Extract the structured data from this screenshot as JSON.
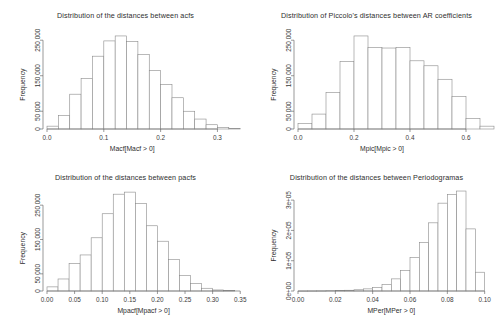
{
  "figure": {
    "panel_count": 4,
    "layout": "2x2",
    "background_color": "#ffffff",
    "bar_fill": "#ffffff",
    "bar_stroke": "#8a8a8a",
    "axis_color": "#6e6e6e"
  },
  "chart_data": [
    {
      "id": "acf",
      "type": "bar",
      "title": "Distribution of the distances between acfs",
      "xlabel": "Macf[Macf > 0]",
      "ylabel": "Frequency",
      "xlim": [
        0.0,
        0.345
      ],
      "ylim": [
        0,
        290000
      ],
      "xticks": [
        0.0,
        0.1,
        0.2,
        0.3
      ],
      "xticklabels": [
        "0.0",
        "0.1",
        "0.2",
        "0.3"
      ],
      "yticks": [
        0,
        50000,
        150000,
        250000
      ],
      "yticklabels": [
        "0",
        "50 000",
        "150 000",
        "250 000"
      ],
      "grid": false,
      "legend": "none",
      "bin_width": 0.02,
      "bin_edges": [
        0.0,
        0.02,
        0.04,
        0.06,
        0.08,
        0.1,
        0.12,
        0.14,
        0.16,
        0.18,
        0.2,
        0.22,
        0.24,
        0.26,
        0.28,
        0.3,
        0.32,
        0.34
      ],
      "values": [
        8000,
        38000,
        98000,
        142000,
        205000,
        248000,
        262000,
        246000,
        210000,
        165000,
        125000,
        88000,
        50000,
        28000,
        12000,
        4000,
        1500
      ]
    },
    {
      "id": "piccolo",
      "type": "bar",
      "title": "Distribution of Piccolo's distances between AR coefficients",
      "xlabel": "Mpic[Mpic > 0]",
      "ylabel": "Frequency",
      "xlim": [
        0.0,
        0.7
      ],
      "ylim": [
        0,
        290000
      ],
      "xticks": [
        0.0,
        0.2,
        0.4,
        0.6
      ],
      "xticklabels": [
        "0.0",
        "0.2",
        "0.4",
        "0.6"
      ],
      "yticks": [
        0,
        50000,
        150000,
        250000
      ],
      "yticklabels": [
        "0",
        "50 000",
        "150 000",
        "250 000"
      ],
      "grid": false,
      "legend": "none",
      "bin_width": 0.05,
      "bin_edges": [
        0.0,
        0.05,
        0.1,
        0.15,
        0.2,
        0.25,
        0.3,
        0.35,
        0.4,
        0.45,
        0.5,
        0.55,
        0.6,
        0.65,
        0.7
      ],
      "values": [
        15000,
        42000,
        103000,
        190000,
        262000,
        230000,
        228000,
        229000,
        192000,
        178000,
        140000,
        92000,
        30000,
        8000
      ]
    },
    {
      "id": "pacf",
      "type": "bar",
      "title": "Distribution of the distances between pacfs",
      "xlabel": "Mpacf[Mpacf > 0]",
      "ylabel": "Frequency",
      "xlim": [
        0.0,
        0.355
      ],
      "ylim": [
        0,
        300000
      ],
      "xticks": [
        0.0,
        0.05,
        0.1,
        0.15,
        0.2,
        0.25,
        0.3,
        0.35
      ],
      "xticklabels": [
        "0.00",
        "0.05",
        "0.10",
        "0.15",
        "0.20",
        "0.25",
        "0.30",
        "0.35"
      ],
      "yticks": [
        0,
        50000,
        150000,
        250000
      ],
      "yticklabels": [
        "0",
        "50 000",
        "150 000",
        "250 000"
      ],
      "grid": false,
      "legend": "none",
      "bin_width": 0.02,
      "bin_edges": [
        0.0,
        0.02,
        0.04,
        0.06,
        0.08,
        0.1,
        0.12,
        0.14,
        0.16,
        0.18,
        0.2,
        0.22,
        0.24,
        0.26,
        0.28,
        0.3,
        0.32,
        0.34
      ],
      "values": [
        12000,
        35000,
        80000,
        105000,
        155000,
        225000,
        282000,
        288000,
        255000,
        190000,
        145000,
        92000,
        45000,
        22000,
        8000,
        3000,
        1000
      ]
    },
    {
      "id": "periodogram",
      "type": "bar",
      "title": "Distribution of the distances between Periodogramas",
      "xlabel": "MPer[MPer > 0]",
      "ylabel": "Frequency",
      "xlim": [
        0.0,
        0.105
      ],
      "ylim": [
        0,
        340000
      ],
      "xticks": [
        0.0,
        0.02,
        0.04,
        0.06,
        0.08,
        0.1
      ],
      "xticklabels": [
        "0.00",
        "0.02",
        "0.04",
        "0.06",
        "0.08",
        "0.10"
      ],
      "yticks": [
        0,
        100000,
        200000,
        300000
      ],
      "yticklabels": [
        "0e+00",
        "1e+05",
        "2e+05",
        "3e+05"
      ],
      "grid": false,
      "legend": "none",
      "bin_width": 0.005,
      "bin_edges": [
        0.0,
        0.005,
        0.01,
        0.015,
        0.02,
        0.025,
        0.03,
        0.035,
        0.04,
        0.045,
        0.05,
        0.055,
        0.06,
        0.065,
        0.07,
        0.075,
        0.08,
        0.085,
        0.09,
        0.095,
        0.1
      ],
      "values": [
        200,
        300,
        500,
        900,
        1500,
        2500,
        4000,
        7000,
        12000,
        22000,
        40000,
        68000,
        110000,
        160000,
        225000,
        290000,
        318000,
        330000,
        205000,
        62000
      ]
    }
  ]
}
